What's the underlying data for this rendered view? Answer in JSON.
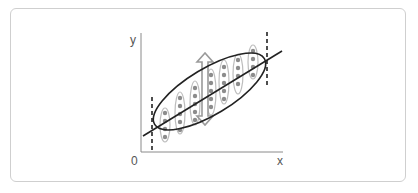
{
  "diagram": {
    "type": "scatter-regression-illustration",
    "axes": {
      "y_label": "y",
      "x_label": "x",
      "origin_label": "0"
    },
    "elements": {
      "regression_line": "straight line through data cloud",
      "confidence_ellipse": "tilted ellipse enclosing data",
      "boundary_lines": [
        "dashed vertical line at left end",
        "dashed vertical line at right end"
      ],
      "data_columns": 7,
      "double_arrow": "vertical double-headed arrow indicating spread"
    },
    "colors": {
      "axis": "#8a8a8a",
      "line": "#222222",
      "dots": "#8c8c8c",
      "column_outline": "#bdbdbd",
      "arrow": "#9a9a9a",
      "frame": "#cfcfcf"
    }
  }
}
